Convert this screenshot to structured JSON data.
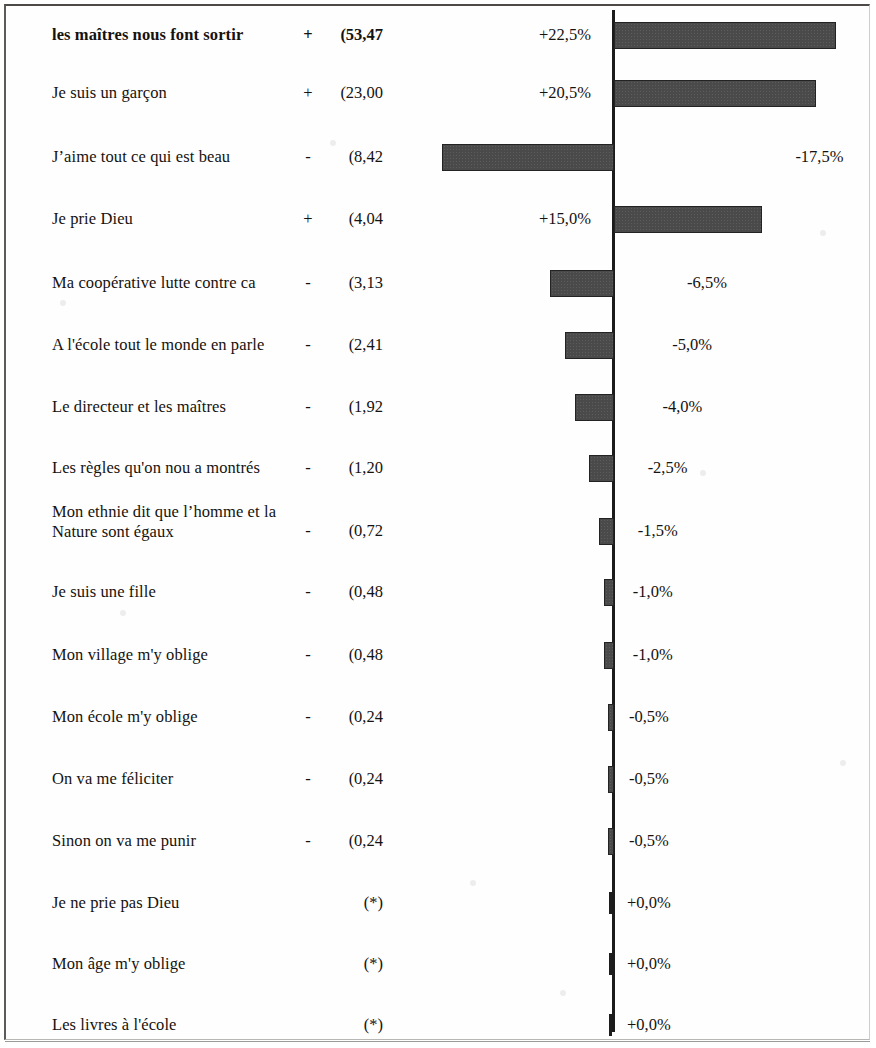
{
  "chart_data": {
    "type": "bar",
    "title": "",
    "subtitle": "",
    "xlabel": "",
    "ylabel": "",
    "orientation": "horizontal",
    "diverging": true,
    "grid": false,
    "legend": null,
    "axis_zero_label": "0",
    "xlim": [
      -20.0,
      25.0
    ],
    "value_column_note": "khi2 contribution (parenthesised)",
    "categories": [
      "les maîtres nous font sortir",
      "Je suis un garçon",
      "J’aime tout ce qui est beau",
      "Je prie Dieu",
      "Ma coopérative lutte contre ca",
      "A l'école tout le monde en parle",
      "Le directeur et les maîtres",
      "Les règles qu'on nou a montrés",
      "Mon ethnie dit que l’homme et la\nNature sont égaux",
      "Je suis une fille",
      "Mon village m'y oblige",
      "Mon école m'y oblige",
      "On va me féliciter",
      "Sinon on va me punir",
      "Je ne prie pas Dieu",
      "Mon âge m'y oblige",
      "Les livres à l'école"
    ],
    "values": [
      22.5,
      20.5,
      -17.5,
      15.0,
      -6.5,
      -5.0,
      -4.0,
      -2.5,
      -1.5,
      -1.0,
      -1.0,
      -0.5,
      -0.5,
      -0.5,
      0.0,
      0.0,
      0.0
    ],
    "value_labels": [
      "+22,5%",
      "+20,5%",
      "-17,5%",
      "+15,0%",
      "-6,5%",
      "-5,0%",
      "-4,0%",
      "-2,5%",
      "-1,5%",
      "-1,0%",
      "-1,0%",
      "-0,5%",
      "-0,5%",
      "-0,5%",
      "+0,0%",
      "+0,0%",
      "+0,0%"
    ],
    "signs": [
      "+",
      "+",
      "-",
      "+",
      "-",
      "-",
      "-",
      "-",
      "-",
      "-",
      "-",
      "-",
      "-",
      "-",
      "",
      "",
      ""
    ],
    "stat_labels": [
      "(53,47",
      "(23,00",
      "(8,42",
      "(4,04",
      "(3,13",
      "(2,41",
      "(1,92",
      "(1,20",
      "(0,72",
      "(0,48",
      "(0,48",
      "(0,24",
      "(0,24",
      "(0,24",
      "(*)",
      "(*)",
      "(*)"
    ],
    "stat_values": [
      53.47,
      23.0,
      8.42,
      4.04,
      3.13,
      2.41,
      1.92,
      1.2,
      0.72,
      0.48,
      0.48,
      0.24,
      0.24,
      0.24,
      null,
      null,
      null
    ],
    "colors": {
      "bar_fill": "#4a4a4a",
      "bar_stroke": "#232323",
      "axis": "#1b1b1b",
      "text": "#15120f",
      "background": "#ffffff",
      "frame": "#5d5a57"
    }
  },
  "rows": [
    {
      "label": "les maîtres nous font sortir",
      "sign": "+",
      "stat": "(53,47",
      "pct": "+22,5%",
      "bold": true
    },
    {
      "label": "Je suis un garçon",
      "sign": "+",
      "stat": "(23,00",
      "pct": "+20,5%",
      "bold": false
    },
    {
      "label": "J’aime tout ce qui est beau",
      "sign": "-",
      "stat": "(8,42",
      "pct": "-17,5%",
      "bold": false
    },
    {
      "label": "Je prie Dieu",
      "sign": "+",
      "stat": "(4,04",
      "pct": "+15,0%",
      "bold": false
    },
    {
      "label": "Ma coopérative lutte contre ca",
      "sign": "-",
      "stat": "(3,13",
      "pct": "-6,5%",
      "bold": false
    },
    {
      "label": "A l'école tout le monde en parle",
      "sign": "-",
      "stat": "(2,41",
      "pct": "-5,0%",
      "bold": false
    },
    {
      "label": "Le directeur et les maîtres",
      "sign": "-",
      "stat": "(1,92",
      "pct": "-4,0%",
      "bold": false
    },
    {
      "label": "Les règles qu'on nou a montrés",
      "sign": "-",
      "stat": "(1,20",
      "pct": "-2,5%",
      "bold": false
    },
    {
      "label": "Mon ethnie dit que l’homme et la\nNature sont égaux",
      "sign": "-",
      "stat": "(0,72",
      "pct": "-1,5%",
      "bold": false
    },
    {
      "label": "Je suis une fille",
      "sign": "-",
      "stat": "(0,48",
      "pct": "-1,0%",
      "bold": false
    },
    {
      "label": "Mon village m'y oblige",
      "sign": "-",
      "stat": "(0,48",
      "pct": "-1,0%",
      "bold": false
    },
    {
      "label": "Mon école m'y oblige",
      "sign": "-",
      "stat": "(0,24",
      "pct": "-0,5%",
      "bold": false
    },
    {
      "label": "On va me féliciter",
      "sign": "-",
      "stat": "(0,24",
      "pct": "-0,5%",
      "bold": false
    },
    {
      "label": "Sinon on va me punir",
      "sign": "-",
      "stat": "(0,24",
      "pct": "-0,5%",
      "bold": false
    },
    {
      "label": "Je ne prie pas Dieu",
      "sign": "",
      "stat": "(*)",
      "pct": "+0,0%",
      "bold": false
    },
    {
      "label": "Mon âge m'y oblige",
      "sign": "",
      "stat": "(*)",
      "pct": "+0,0%",
      "bold": false
    },
    {
      "label": "Les livres à l'école",
      "sign": "",
      "stat": "(*)",
      "pct": "+0,0%",
      "bold": false
    }
  ],
  "geometry": {
    "axis_x": 613,
    "px_per_percent": 9.85,
    "bar_height": 27,
    "row_centers": [
      35,
      93,
      157,
      219,
      283,
      345,
      407,
      468,
      531,
      592,
      655,
      717,
      779,
      841,
      903,
      964,
      1025
    ]
  }
}
